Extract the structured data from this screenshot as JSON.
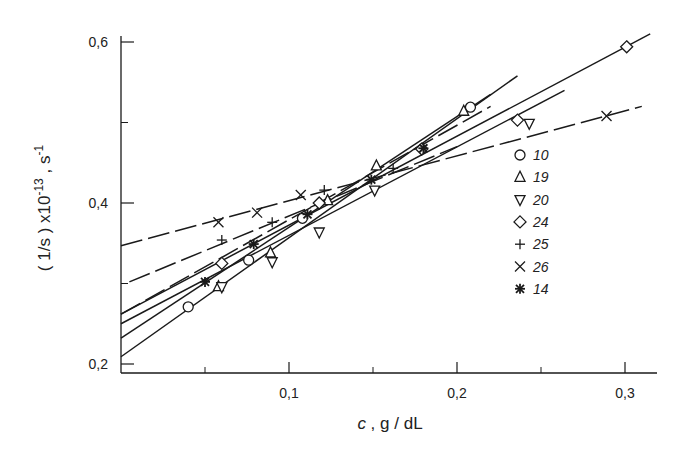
{
  "chart_data": {
    "type": "scatter",
    "title": "",
    "xlabel_var": "c",
    "xlabel_unit": " , g / dL",
    "ylabel_main": "( 1/s ) x10",
    "ylabel_exp": "-13",
    "ylabel_unit": " ,  s",
    "ylabel_unit_exp": "-1",
    "xlim": [
      0,
      0.32
    ],
    "ylim": [
      0.2,
      0.6
    ],
    "x_ticks": [
      0.1,
      0.2,
      0.3
    ],
    "x_tick_labels": [
      "0,1",
      "0,2",
      "0,3"
    ],
    "x_minor_ticks": [
      0.05,
      0.15,
      0.25
    ],
    "y_ticks": [
      0.2,
      0.4,
      0.6
    ],
    "y_tick_labels": [
      "0,2",
      "0,4",
      "0,6"
    ],
    "y_minor_ticks": [
      0.3,
      0.5
    ],
    "grid": false,
    "legend_position": "right-inside",
    "series": [
      {
        "name": "10",
        "marker": "circle",
        "x": [
          0.04,
          0.076,
          0.108,
          0.208
        ],
        "y": [
          0.271,
          0.329,
          0.381,
          0.519
        ],
        "line": {
          "x0": 0.0,
          "y0": 0.209,
          "x1": 0.236,
          "y1": 0.558,
          "dash": false
        }
      },
      {
        "name": "19",
        "marker": "triangle-up",
        "x": [
          0.058,
          0.089,
          0.123,
          0.152,
          0.204
        ],
        "y": [
          0.296,
          0.338,
          0.403,
          0.446,
          0.514
        ],
        "line": {
          "x0": 0.0,
          "y0": 0.232,
          "x1": 0.22,
          "y1": 0.535,
          "dash": false
        }
      },
      {
        "name": "20",
        "marker": "triangle-down",
        "x": [
          0.06,
          0.09,
          0.118,
          0.151,
          0.243
        ],
        "y": [
          0.296,
          0.327,
          0.364,
          0.416,
          0.499
        ],
        "line": {
          "x0": 0.0,
          "y0": 0.25,
          "x1": 0.264,
          "y1": 0.54,
          "dash": false
        }
      },
      {
        "name": "24",
        "marker": "diamond",
        "x": [
          0.06,
          0.118,
          0.179,
          0.236,
          0.301
        ],
        "y": [
          0.325,
          0.4,
          0.467,
          0.503,
          0.594
        ],
        "line": {
          "x0": 0.0,
          "y0": 0.262,
          "x1": 0.315,
          "y1": 0.61,
          "dash": false
        }
      },
      {
        "name": "25",
        "marker": "plus",
        "x": [
          0.06,
          0.09,
          0.121,
          0.162
        ],
        "y": [
          0.354,
          0.376,
          0.416,
          0.443
        ],
        "line": {
          "x0": 0.005,
          "y0": 0.302,
          "x1": 0.2,
          "y1": 0.47,
          "dash": true
        }
      },
      {
        "name": "26",
        "marker": "cross",
        "x": [
          0.058,
          0.081,
          0.107,
          0.289
        ],
        "y": [
          0.376,
          0.388,
          0.41,
          0.508
        ],
        "line": {
          "x0": 0.0,
          "y0": 0.347,
          "x1": 0.31,
          "y1": 0.52,
          "dash": true
        }
      },
      {
        "name": "14",
        "marker": "asterisk",
        "x": [
          0.05,
          0.079,
          0.111,
          0.149,
          0.18
        ],
        "y": [
          0.302,
          0.349,
          0.386,
          0.429,
          0.468
        ],
        "line": {
          "x0": 0.0,
          "y0": 0.262,
          "x1": 0.22,
          "y1": 0.52,
          "dash": true
        }
      }
    ]
  },
  "legend": {
    "items": [
      {
        "marker": "circle",
        "label": "10"
      },
      {
        "marker": "triangle-up",
        "label": "19"
      },
      {
        "marker": "triangle-down",
        "label": "20"
      },
      {
        "marker": "diamond",
        "label": "24"
      },
      {
        "marker": "plus",
        "label": "25"
      },
      {
        "marker": "cross",
        "label": "26"
      },
      {
        "marker": "asterisk",
        "label": "14"
      }
    ]
  },
  "colors": {
    "ink": "#1a1a1a",
    "background": "#ffffff"
  }
}
